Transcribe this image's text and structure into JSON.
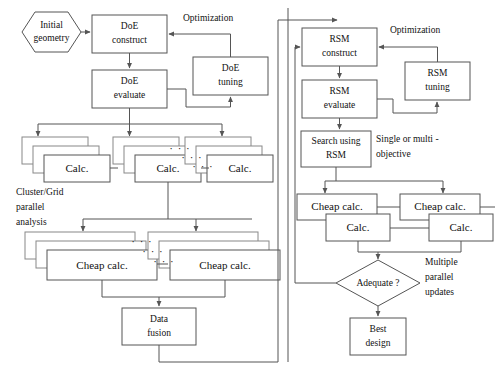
{
  "diagram": {
    "canvas": {
      "width": 495,
      "height": 370
    },
    "nodes": {
      "initial_geometry": {
        "label_line1": "Initial",
        "label_line2": "geometry",
        "shape": "hexagon"
      },
      "doe_construct": {
        "label_line1": "DoE",
        "label_line2": "construct",
        "shape": "rect"
      },
      "doe_evaluate": {
        "label_line1": "DoE",
        "label_line2": "evaluate",
        "shape": "rect"
      },
      "doe_tuning": {
        "label_line1": "DoE",
        "label_line2": "tuning",
        "shape": "rect"
      },
      "calc_1": {
        "label": "Calc.",
        "shape": "stacked-rect"
      },
      "calc_2": {
        "label": "Calc.",
        "shape": "stacked-rect"
      },
      "calc_3": {
        "label": "Calc.",
        "shape": "stacked-rect"
      },
      "cheap_calc_left_1": {
        "label": "Cheap calc.",
        "shape": "stacked-rect"
      },
      "cheap_calc_left_2": {
        "label": "Cheap calc.",
        "shape": "stacked-rect"
      },
      "data_fusion": {
        "label_line1": "Data",
        "label_line2": "fusion",
        "shape": "rect"
      },
      "rsm_construct": {
        "label_line1": "RSM",
        "label_line2": "construct",
        "shape": "rect"
      },
      "rsm_evaluate": {
        "label_line1": "RSM",
        "label_line2": "evaluate",
        "shape": "rect"
      },
      "rsm_tuning": {
        "label_line1": "RSM",
        "label_line2": "tuning",
        "shape": "rect"
      },
      "search_using_rsm": {
        "label_line1": "Search using",
        "label_line2": "RSM",
        "shape": "rect"
      },
      "cheap_calc_right_1": {
        "label": "Cheap calc.",
        "shape": "rect"
      },
      "calc_right_1": {
        "label": "Calc.",
        "shape": "rect"
      },
      "cheap_calc_right_2": {
        "label": "Cheap calc.",
        "shape": "rect"
      },
      "calc_right_2": {
        "label": "Calc.",
        "shape": "rect"
      },
      "adequate": {
        "label": "Adequate ?",
        "shape": "diamond"
      },
      "best_design": {
        "label_line1": "Best",
        "label_line2": "design",
        "shape": "rect"
      }
    },
    "annotations": {
      "optimization_left": "Optimization",
      "optimization_right": "Optimization",
      "cluster_grid_line1": "Cluster/Grid",
      "cluster_grid_line2": "parallel",
      "cluster_grid_line3": "analysis",
      "single_multi_line1": "Single or multi -",
      "single_multi_line2": "objective",
      "multiple_parallel_line1": "Multiple",
      "multiple_parallel_line2": "parallel",
      "multiple_parallel_line3": "updates",
      "ellipsis": "· · ·"
    },
    "colors": {
      "stroke": "#555555",
      "stroke_back": "#888888",
      "fill": "#ffffff",
      "text": "#111111"
    }
  }
}
